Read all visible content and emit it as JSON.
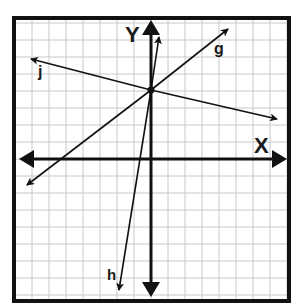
{
  "title_cropped": "",
  "diagram": {
    "type": "coordinate-plane",
    "grid": {
      "cell_px": 17,
      "color": "#c8c8c8"
    },
    "border_color": "#111111",
    "axes": {
      "x_label": "X",
      "y_label": "Y",
      "color": "#111111"
    },
    "intersection_point": {
      "x": 0,
      "y": 4
    },
    "lines": [
      {
        "name": "g",
        "label": "g",
        "from": {
          "x": -7.3,
          "y": -1.5
        },
        "to": {
          "x": 4.5,
          "y": 7.6
        }
      },
      {
        "name": "h",
        "label": "h",
        "from": {
          "x": -1.9,
          "y": -7.7
        },
        "to": {
          "x": 0.5,
          "y": 7.2
        }
      },
      {
        "name": "j",
        "label": "j",
        "from": {
          "x": -7.1,
          "y": 5.9
        },
        "to": {
          "x": 7.4,
          "y": 2.4
        }
      }
    ]
  }
}
